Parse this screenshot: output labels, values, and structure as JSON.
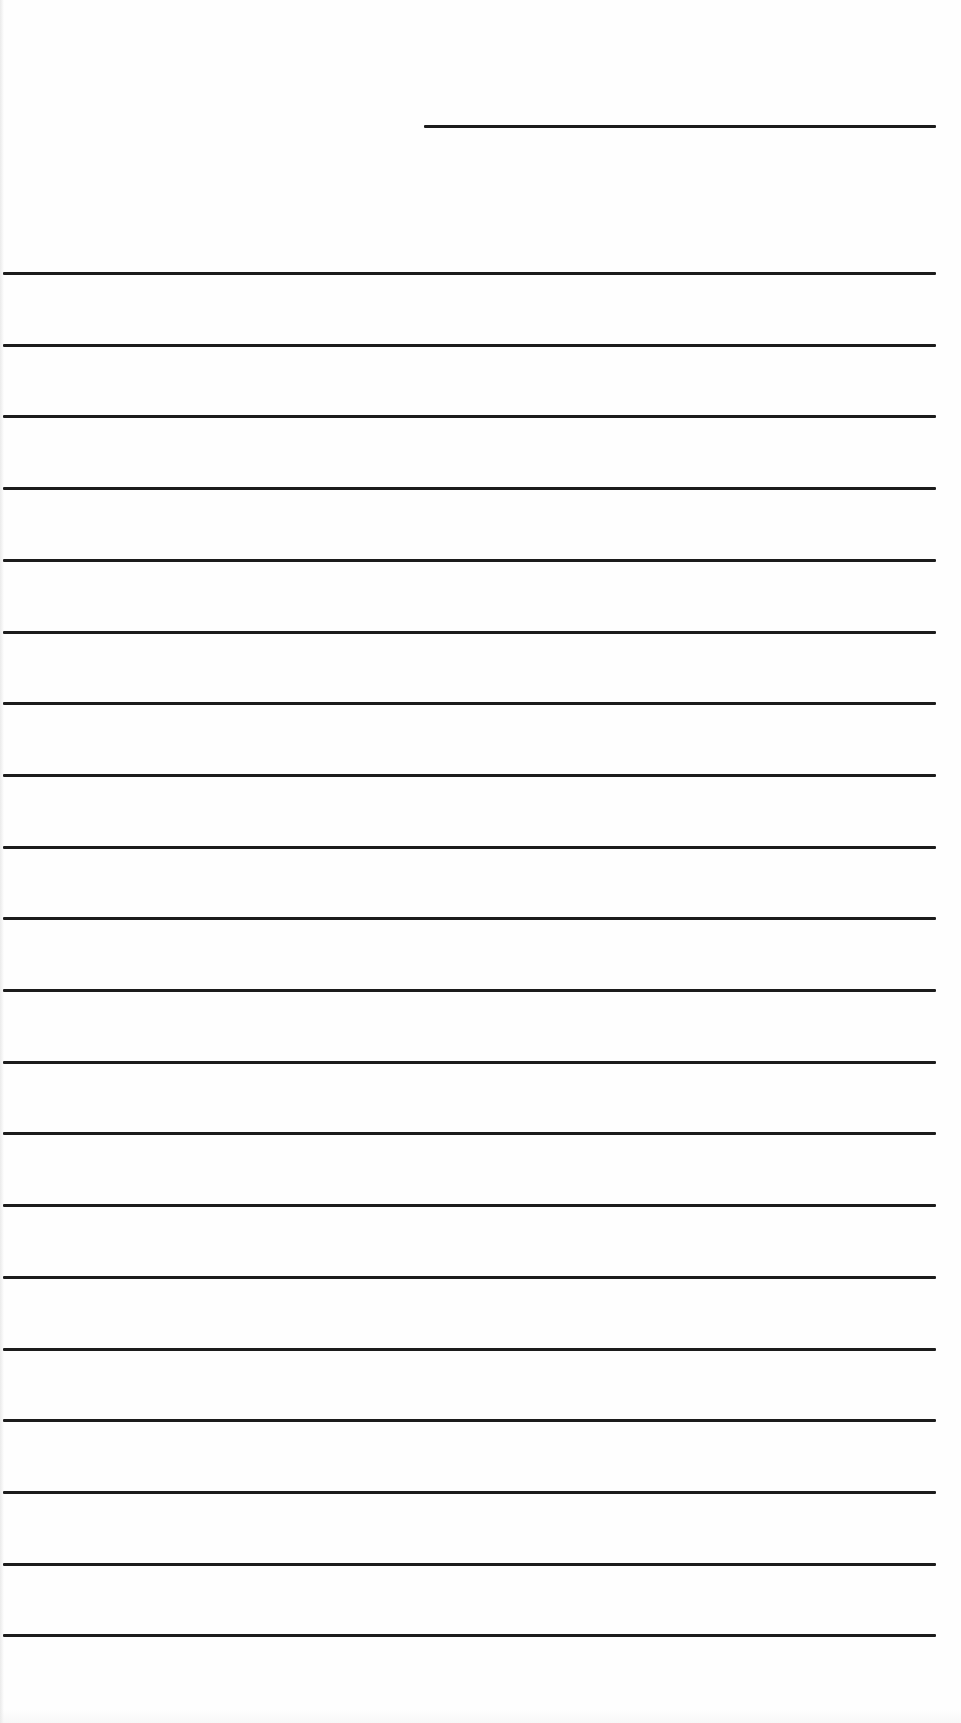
{
  "document": {
    "type": "lined-writing-page",
    "background_color": "#fefefe",
    "rule_color": "#1c1c1c",
    "header_line": {
      "left_px": 424,
      "right_px": 936,
      "y_px": 126
    },
    "ruled_lines": {
      "count": 20,
      "first_y_px": 273,
      "spacing_px": 71.7,
      "left_px": 3,
      "right_px": 936
    },
    "text_content": []
  }
}
